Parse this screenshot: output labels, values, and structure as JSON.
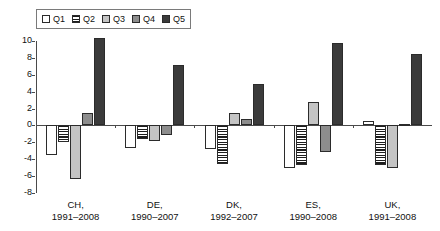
{
  "chart_data": {
    "type": "bar",
    "title": "",
    "subtitle": "",
    "xlabel": "",
    "ylabel": "",
    "ylim": [
      -8,
      10
    ],
    "yticks": [
      10,
      8,
      6,
      4,
      2,
      0,
      -2,
      -4,
      -6,
      -8
    ],
    "ytick_labels": [
      "10",
      "8",
      "6",
      "4",
      "2",
      "0",
      "-2",
      "-4",
      "-6",
      "-8"
    ],
    "grid": false,
    "legend_position": "top-left",
    "orientation": "vertical",
    "grouping": "clustered",
    "categories": [
      "CH,\n1991–2008",
      "DE,\n1990–2007",
      "DK,\n1992–2007",
      "ES,\n1990–2008",
      "UK,\n1991–2008"
    ],
    "category_labels": [
      {
        "country": "CH,",
        "period": "1991–2008"
      },
      {
        "country": "DE,",
        "period": "1990–2007"
      },
      {
        "country": "DK,",
        "period": "1992–2007"
      },
      {
        "country": "ES,",
        "period": "1990–2008"
      },
      {
        "country": "UK,",
        "period": "1991–2008"
      }
    ],
    "series": [
      {
        "name": "Q1",
        "fill": "white",
        "color": "#ffffff",
        "values": [
          -3.5,
          -2.7,
          -2.8,
          -5.0,
          0.5
        ]
      },
      {
        "name": "Q2",
        "fill": "h-stripes",
        "color": "#1d1d1d",
        "values": [
          -2.0,
          -1.6,
          -4.6,
          -4.7,
          -4.7
        ]
      },
      {
        "name": "Q3",
        "fill": "light-gray",
        "color": "#c4c4c4",
        "values": [
          -6.4,
          -1.9,
          1.5,
          2.8,
          -5.0
        ]
      },
      {
        "name": "Q4",
        "fill": "medium-gray",
        "color": "#8d8d8d",
        "values": [
          1.5,
          -1.1,
          0.8,
          -3.2,
          0.2
        ]
      },
      {
        "name": "Q5",
        "fill": "dark-gray",
        "color": "#3b3b3b",
        "values": [
          10.4,
          7.1,
          4.9,
          9.8,
          8.5
        ]
      }
    ]
  },
  "legend": {
    "items": [
      {
        "label": "Q1"
      },
      {
        "label": "Q2"
      },
      {
        "label": "Q3"
      },
      {
        "label": "Q4"
      },
      {
        "label": "Q5"
      }
    ]
  }
}
